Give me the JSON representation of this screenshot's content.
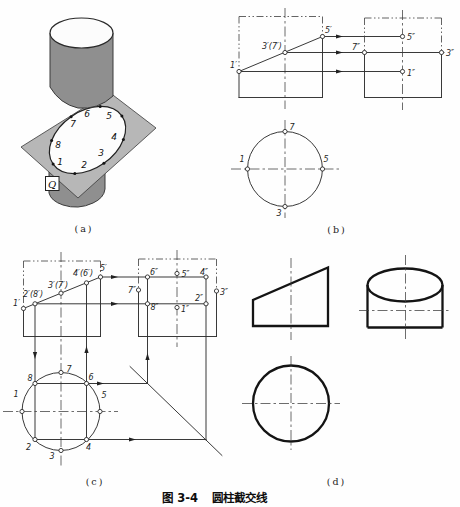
{
  "caption": {
    "figure_no": "图 3-4",
    "title": "圆柱截交线"
  },
  "panel_labels": {
    "a": "(a)",
    "b": "(b)",
    "c": "(c)",
    "d": "(d)"
  },
  "colors": {
    "cylinder": "#8f8f8f",
    "plane": "#b7b7b7",
    "section": "#fdfdfd",
    "line": "#2e2e2e"
  },
  "a": {
    "plane_label": "Q",
    "n1": "1",
    "n2": "2",
    "n3": "3",
    "n4": "4",
    "n5": "5",
    "n6": "6",
    "n7": "7",
    "n8": "8"
  },
  "b": {
    "f1": "1′",
    "f37": "3′(7′)",
    "f5": "5′",
    "s5": "5″",
    "s7": "7″",
    "s3": "3″",
    "s1": "1″",
    "t7": "7",
    "t1": "1",
    "t5": "5",
    "t3": "3"
  },
  "c": {
    "f1": "1′",
    "f28": "2′(8′)",
    "f37": "3′(7′)",
    "f46": "4′(6′)",
    "f5": "5′",
    "s6": "6″",
    "s5": "5″",
    "s4": "4″",
    "s7": "7″",
    "s3": "3″",
    "s8": "8″",
    "s2": "2″",
    "s1": "1″",
    "t1": "1",
    "t2": "2",
    "t3": "3",
    "t4": "4",
    "t5": "5",
    "t6": "6",
    "t7": "7",
    "t8": "8"
  }
}
